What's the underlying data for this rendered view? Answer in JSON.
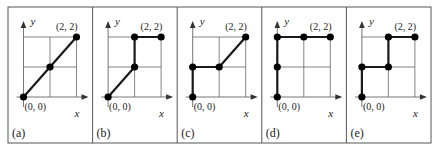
{
  "figure": {
    "colors": {
      "frame": "#555555",
      "grid": "#666666",
      "path": "#1a1a1a",
      "point": "#000000",
      "text": "#222222"
    },
    "axis_labels": {
      "x": "x",
      "y": "y"
    },
    "origin_label": "(0, 0)",
    "end_label": "(2, 2)",
    "panels": [
      {
        "label": "(a)",
        "path": [
          [
            0,
            0
          ],
          [
            1,
            1
          ],
          [
            2,
            2
          ]
        ],
        "points": [
          [
            0,
            0
          ],
          [
            1,
            1
          ],
          [
            2,
            2
          ]
        ]
      },
      {
        "label": "(b)",
        "path": [
          [
            0,
            0
          ],
          [
            1,
            1
          ],
          [
            1,
            2
          ],
          [
            2,
            2
          ]
        ],
        "points": [
          [
            0,
            0
          ],
          [
            1,
            1
          ],
          [
            1,
            2
          ],
          [
            2,
            2
          ]
        ]
      },
      {
        "label": "(c)",
        "path": [
          [
            0,
            0
          ],
          [
            0,
            1
          ],
          [
            1,
            1
          ],
          [
            2,
            2
          ]
        ],
        "points": [
          [
            0,
            0
          ],
          [
            0,
            1
          ],
          [
            1,
            1
          ],
          [
            2,
            2
          ]
        ]
      },
      {
        "label": "(d)",
        "path": [
          [
            0,
            0
          ],
          [
            0,
            1
          ],
          [
            0,
            2
          ],
          [
            1,
            2
          ],
          [
            2,
            2
          ]
        ],
        "points": [
          [
            0,
            0
          ],
          [
            0,
            1
          ],
          [
            0,
            2
          ],
          [
            1,
            2
          ],
          [
            2,
            2
          ]
        ]
      },
      {
        "label": "(e)",
        "path": [
          [
            0,
            0
          ],
          [
            0,
            1
          ],
          [
            1,
            1
          ],
          [
            1,
            2
          ],
          [
            2,
            2
          ]
        ],
        "points": [
          [
            0,
            0
          ],
          [
            0,
            1
          ],
          [
            1,
            1
          ],
          [
            1,
            2
          ],
          [
            2,
            2
          ]
        ]
      }
    ]
  }
}
